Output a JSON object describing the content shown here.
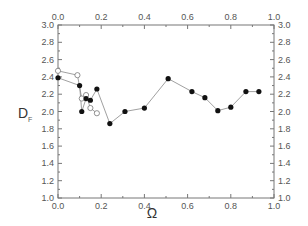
{
  "chart_data": {
    "type": "line",
    "title": "",
    "xlabel": "Ω",
    "ylabel": "D_F",
    "xlim": [
      0.0,
      1.0
    ],
    "ylim": [
      1.0,
      3.0
    ],
    "xticks": [
      "0.0",
      "0.2",
      "0.4",
      "0.6",
      "0.8",
      "1.0"
    ],
    "yticks": [
      "1.0",
      "1.2",
      "1.4",
      "1.6",
      "1.8",
      "2.0",
      "2.2",
      "2.4",
      "2.6",
      "2.8",
      "3.0"
    ],
    "grid": false,
    "legend": null,
    "series": [
      {
        "name": "filled",
        "marker": "filled-circle",
        "color": "#111111",
        "x": [
          0.0,
          0.1,
          0.11,
          0.13,
          0.15,
          0.18,
          0.24,
          0.31,
          0.4,
          0.51,
          0.62,
          0.68,
          0.74,
          0.8,
          0.87,
          0.93
        ],
        "y": [
          2.39,
          2.3,
          2.0,
          2.15,
          2.13,
          2.26,
          1.86,
          2.0,
          2.04,
          2.38,
          2.23,
          2.16,
          2.01,
          2.05,
          2.23,
          2.23
        ]
      },
      {
        "name": "open",
        "marker": "open-circle",
        "color": "#777777",
        "x": [
          0.0,
          0.09,
          0.11,
          0.13,
          0.15,
          0.18
        ],
        "y": [
          2.47,
          2.42,
          2.15,
          2.19,
          2.04,
          1.98
        ]
      }
    ]
  }
}
